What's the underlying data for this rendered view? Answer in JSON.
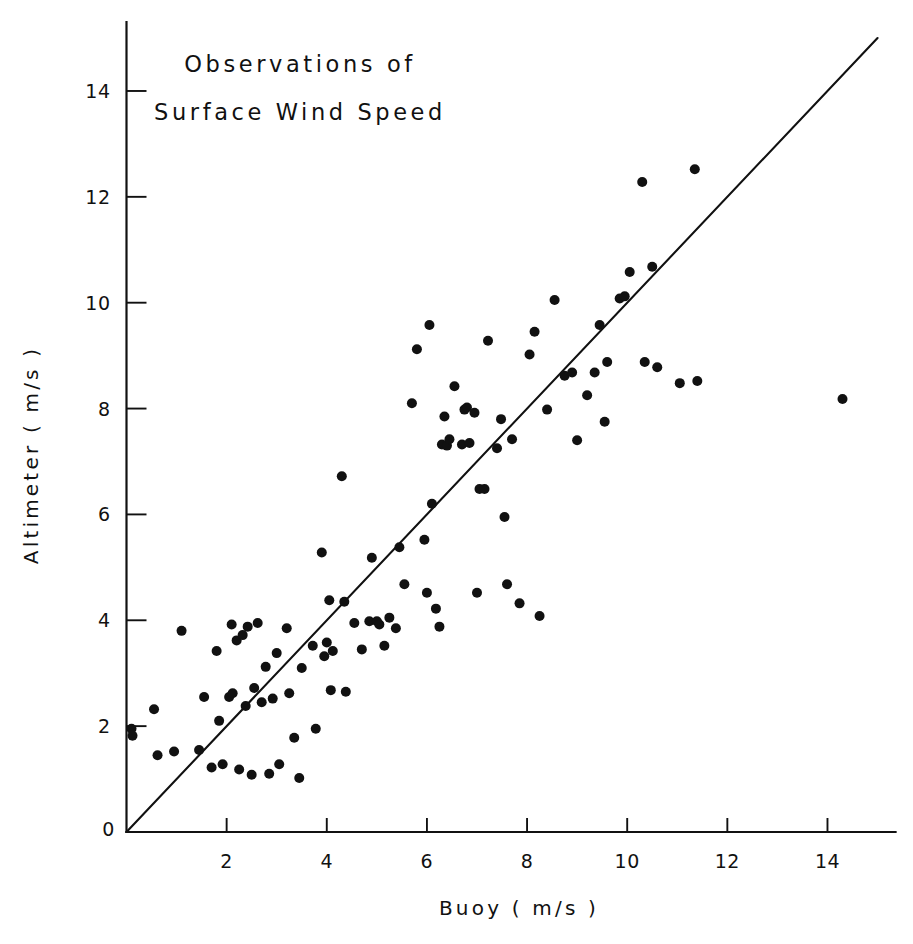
{
  "chart_data": {
    "type": "scatter",
    "title": "Observations of Surface Wind Speed",
    "title_lines": [
      "Observations of",
      "Surface Wind Speed"
    ],
    "xlabel": "Buoy ( m/s )",
    "ylabel": "Altimeter ( m/s )",
    "xlim": [
      0,
      15
    ],
    "ylim": [
      0,
      15
    ],
    "xticks": [
      0,
      2,
      4,
      6,
      8,
      10,
      12,
      14
    ],
    "xtick_labels": [
      "0",
      "2",
      "4",
      "6",
      "8",
      "10",
      "12",
      "14"
    ],
    "yticks": [
      0,
      2,
      4,
      6,
      8,
      10,
      12,
      14
    ],
    "ytick_labels": [
      "0",
      "2",
      "4",
      "6",
      "8",
      "10",
      "12",
      "14"
    ],
    "grid": false,
    "legend": null,
    "marker": "filled-circle",
    "marker_color": "#111111",
    "marker_size_px": 6.0,
    "reference_line": {
      "name": "one-to-one-line",
      "description": "1:1 diagonal line y = x",
      "slope": 1,
      "intercept": 0,
      "x_start": 0,
      "y_start": 0,
      "x_end": 15,
      "y_end": 15,
      "color": "#111111"
    },
    "series": [
      {
        "name": "Altimeter vs Buoy wind speed observations",
        "n_points": 108,
        "points": [
          [
            0.1,
            1.95
          ],
          [
            0.12,
            1.82
          ],
          [
            0.55,
            2.32
          ],
          [
            0.62,
            1.45
          ],
          [
            0.95,
            1.52
          ],
          [
            1.1,
            3.8
          ],
          [
            1.45,
            1.55
          ],
          [
            1.55,
            2.55
          ],
          [
            1.7,
            1.22
          ],
          [
            1.8,
            3.42
          ],
          [
            1.85,
            2.1
          ],
          [
            1.92,
            1.28
          ],
          [
            2.05,
            2.55
          ],
          [
            2.1,
            3.92
          ],
          [
            2.12,
            2.62
          ],
          [
            2.2,
            3.62
          ],
          [
            2.25,
            1.18
          ],
          [
            2.32,
            3.72
          ],
          [
            2.38,
            2.38
          ],
          [
            2.42,
            3.88
          ],
          [
            2.5,
            1.08
          ],
          [
            2.55,
            2.72
          ],
          [
            2.62,
            3.95
          ],
          [
            2.7,
            2.45
          ],
          [
            2.78,
            3.12
          ],
          [
            2.85,
            1.1
          ],
          [
            2.92,
            2.52
          ],
          [
            3.0,
            3.38
          ],
          [
            3.05,
            1.28
          ],
          [
            3.2,
            3.85
          ],
          [
            3.25,
            2.62
          ],
          [
            3.35,
            1.78
          ],
          [
            3.45,
            1.02
          ],
          [
            3.5,
            3.1
          ],
          [
            3.72,
            3.52
          ],
          [
            3.78,
            1.95
          ],
          [
            3.9,
            5.28
          ],
          [
            3.95,
            3.32
          ],
          [
            4.0,
            3.58
          ],
          [
            4.05,
            4.38
          ],
          [
            4.08,
            2.68
          ],
          [
            4.12,
            3.42
          ],
          [
            4.3,
            6.72
          ],
          [
            4.35,
            4.35
          ],
          [
            4.38,
            2.65
          ],
          [
            4.55,
            3.95
          ],
          [
            4.7,
            3.45
          ],
          [
            4.85,
            3.98
          ],
          [
            4.9,
            5.18
          ],
          [
            5.0,
            3.98
          ],
          [
            5.05,
            3.92
          ],
          [
            5.15,
            3.52
          ],
          [
            5.25,
            4.05
          ],
          [
            5.38,
            3.85
          ],
          [
            5.45,
            5.38
          ],
          [
            5.55,
            4.68
          ],
          [
            5.7,
            8.1
          ],
          [
            5.8,
            9.12
          ],
          [
            5.95,
            5.52
          ],
          [
            6.0,
            4.52
          ],
          [
            6.05,
            9.58
          ],
          [
            6.1,
            6.2
          ],
          [
            6.18,
            4.22
          ],
          [
            6.25,
            3.88
          ],
          [
            6.3,
            7.32
          ],
          [
            6.35,
            7.85
          ],
          [
            6.4,
            7.3
          ],
          [
            6.45,
            7.42
          ],
          [
            6.55,
            8.42
          ],
          [
            6.7,
            7.32
          ],
          [
            6.75,
            7.98
          ],
          [
            6.8,
            8.02
          ],
          [
            6.85,
            7.35
          ],
          [
            6.95,
            7.92
          ],
          [
            7.0,
            4.52
          ],
          [
            7.05,
            6.48
          ],
          [
            7.15,
            6.48
          ],
          [
            7.22,
            9.28
          ],
          [
            7.4,
            7.25
          ],
          [
            7.48,
            7.8
          ],
          [
            7.55,
            5.95
          ],
          [
            7.6,
            4.68
          ],
          [
            7.7,
            7.42
          ],
          [
            7.85,
            4.32
          ],
          [
            8.05,
            9.02
          ],
          [
            8.15,
            9.45
          ],
          [
            8.25,
            4.08
          ],
          [
            8.4,
            7.98
          ],
          [
            8.55,
            10.05
          ],
          [
            8.75,
            8.62
          ],
          [
            8.9,
            8.68
          ],
          [
            9.0,
            7.4
          ],
          [
            9.2,
            8.25
          ],
          [
            9.35,
            8.68
          ],
          [
            9.45,
            9.58
          ],
          [
            9.55,
            7.75
          ],
          [
            9.6,
            8.88
          ],
          [
            9.85,
            10.08
          ],
          [
            9.95,
            10.12
          ],
          [
            10.05,
            10.58
          ],
          [
            10.3,
            12.28
          ],
          [
            10.35,
            8.88
          ],
          [
            10.5,
            10.68
          ],
          [
            10.6,
            8.78
          ],
          [
            11.05,
            8.48
          ],
          [
            11.35,
            12.52
          ],
          [
            11.4,
            8.52
          ],
          [
            14.3,
            8.18
          ]
        ]
      }
    ]
  },
  "figure": {
    "background_color": "#ffffff",
    "foreground_color": "#111111"
  }
}
